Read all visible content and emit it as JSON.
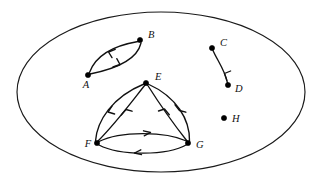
{
  "figure": {
    "background_color": "#ffffff",
    "stroke_color": "#111111",
    "width": 317,
    "height": 183
  },
  "boundary": {
    "shape": "ellipse",
    "cx": 161,
    "cy": 92,
    "rx": 144,
    "ry": 80,
    "stroke_color": "#1a1a1a"
  },
  "vertices": [
    {
      "id": "A",
      "label": "A",
      "x": 88,
      "y": 75,
      "label_x": 86,
      "label_y": 88,
      "label_anchor": "middle"
    },
    {
      "id": "B",
      "label": "B",
      "x": 140,
      "y": 40,
      "label_x": 148,
      "label_y": 38,
      "label_anchor": "start"
    },
    {
      "id": "C",
      "label": "C",
      "x": 212,
      "y": 48,
      "label_x": 220,
      "label_y": 46,
      "label_anchor": "start"
    },
    {
      "id": "D",
      "label": "D",
      "x": 228,
      "y": 85,
      "label_x": 235,
      "label_y": 92,
      "label_anchor": "start"
    },
    {
      "id": "E",
      "label": "E",
      "x": 146,
      "y": 83,
      "label_x": 155,
      "label_y": 80,
      "label_anchor": "start"
    },
    {
      "id": "F",
      "label": "F",
      "x": 97,
      "y": 143,
      "label_x": 88,
      "label_y": 147,
      "label_anchor": "middle"
    },
    {
      "id": "G",
      "label": "G",
      "x": 188,
      "y": 143,
      "label_x": 196,
      "label_y": 148,
      "label_anchor": "start"
    },
    {
      "id": "H",
      "label": "H",
      "x": 224,
      "y": 118,
      "label_x": 232,
      "label_y": 122,
      "label_anchor": "start"
    }
  ],
  "edges": [
    {
      "id": "A-B",
      "from": "A",
      "to": "B",
      "directed": true,
      "path": "M 89.5 72.5 C 94 60 106 47 138 41.5",
      "arrow": "M 108.5 52.0 L 115.2 49.3 M 108.5 52.0 L 112.0 57.6"
    },
    {
      "id": "B-A",
      "from": "B",
      "to": "A",
      "directed": true,
      "path": "M 141 43 C 138 56 125 67 90 74",
      "arrow": "M 120.0 64.5 L 113.0 67.0 M 120.0 64.5 L 116.8 58.7"
    },
    {
      "id": "C-D",
      "from": "C",
      "to": "D",
      "directed": true,
      "path": "M 213 50.5 C 217 60 225 70 227.5 83",
      "arrow": "M 224.5 73.5 L 226.8 80.4 M 224.5 73.5 L 230.6 71.0"
    },
    {
      "id": "F-E",
      "from": "F",
      "to": "E",
      "directed": true,
      "path": "M 95.5 141 C 97 121 112 97 144 84",
      "arrow": "M 108.0 112.0 L 112.0 106.2 M 108.0 112.0 L 114.6 114.0"
    },
    {
      "id": "E-F",
      "from": "E",
      "to": "F",
      "directed": true,
      "path": "M 145 85 C 133 100 116 123 98 141",
      "arrow": "M 126.0 109.5 L 121.3 115.0 M 126.0 109.5 L 132.0 111.2"
    },
    {
      "id": "E-G",
      "from": "E",
      "to": "G",
      "directed": true,
      "path": "M 147.5 85 C 157 100 172 122 187 141",
      "arrow": "M 164.5 109.0 L 169.3 114.8 M 164.5 109.0 L 158.5 111.0"
    },
    {
      "id": "G-E",
      "from": "G",
      "to": "E",
      "directed": true,
      "path": "M 189.5 141 C 190 120 177 97 148 84",
      "arrow": "M 179.5 110.5 L 175.0 104.8 M 179.5 110.5 L 185.8 112.2"
    },
    {
      "id": "F-G",
      "from": "F",
      "to": "G",
      "directed": true,
      "path": "M 99 141.5 C 120 131 165 131 186.5 141",
      "arrow": "M 150.5 132.5 L 143.5 130.8 M 150.5 132.5 L 144.2 135.8"
    },
    {
      "id": "G-F",
      "from": "G",
      "to": "F",
      "directed": true,
      "path": "M 187 144.5 C 167 156 120 156 99 145",
      "arrow": "M 134.5 153.0 L 141.5 154.6 M 134.5 153.0 L 140.8 149.8"
    }
  ],
  "components": [
    {
      "name": "A-B pair",
      "members": [
        "A",
        "B"
      ]
    },
    {
      "name": "C-D pair",
      "members": [
        "C",
        "D"
      ]
    },
    {
      "name": "E-F-G triangle",
      "members": [
        "E",
        "F",
        "G"
      ]
    },
    {
      "name": "H isolated",
      "members": [
        "H"
      ]
    }
  ]
}
